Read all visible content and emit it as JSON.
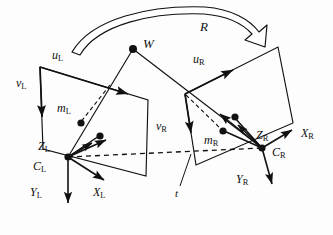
{
  "figure": {
    "background_color": "#fdfdfd",
    "stroke_color": "#111111",
    "labels": {
      "rotation": "R",
      "translation": "t",
      "world_point": "W",
      "left_image_point": "m",
      "left_image_point_sub": "L",
      "right_image_point": "m",
      "right_image_point_sub": "R",
      "left_u_axis": "u",
      "left_u_axis_sub": "L",
      "left_v_axis": "v",
      "left_v_axis_sub": "L",
      "right_u_axis": "u",
      "right_u_axis_sub": "R",
      "right_v_axis": "v",
      "right_v_axis_sub": "R",
      "left_center": "C",
      "left_center_sub": "L",
      "left_x_axis": "X",
      "left_x_axis_sub": "L",
      "left_y_axis": "Y",
      "left_y_axis_sub": "L",
      "left_z_axis": "Z",
      "left_z_axis_sub": "L",
      "right_center": "C",
      "right_center_sub": "R",
      "right_x_axis": "X",
      "right_x_axis_sub": "R",
      "right_y_axis": "Y",
      "right_y_axis_sub": "R",
      "right_z_axis": "Z",
      "right_z_axis_sub": "R"
    },
    "label_positions": {
      "rotation": {
        "x": 200,
        "y": 27,
        "size": "size-main"
      },
      "world_point": {
        "x": 143,
        "y": 44,
        "size": "size-main"
      },
      "left_u_axis": {
        "x": 52,
        "y": 56,
        "size": "size-axis"
      },
      "left_v_axis": {
        "x": 18,
        "y": 84,
        "size": "size-axis"
      },
      "left_image_point": {
        "x": 58,
        "y": 109,
        "size": "size-axis"
      },
      "right_u_axis": {
        "x": 193,
        "y": 60,
        "size": "size-axis"
      },
      "right_v_axis": {
        "x": 157,
        "y": 127,
        "size": "size-axis"
      },
      "right_image_point": {
        "x": 205,
        "y": 141,
        "size": "size-axis"
      },
      "left_z_axis": {
        "x": 40,
        "y": 147,
        "size": "size-axis"
      },
      "left_center": {
        "x": 34,
        "y": 166,
        "size": "size-axis"
      },
      "left_y_axis": {
        "x": 31,
        "y": 192,
        "size": "size-axis"
      },
      "left_x_axis": {
        "x": 94,
        "y": 192,
        "size": "size-axis"
      },
      "right_z_axis": {
        "x": 258,
        "y": 136,
        "size": "size-axis"
      },
      "right_x_axis": {
        "x": 303,
        "y": 135,
        "size": "size-axis"
      },
      "right_center": {
        "x": 274,
        "y": 152,
        "size": "size-axis"
      },
      "right_y_axis": {
        "x": 238,
        "y": 180,
        "size": "size-axis"
      },
      "translation": {
        "x": 176,
        "y": 193,
        "size": "size-small"
      }
    },
    "geometry": {
      "left_plane": "40,67 148,100 146,176 43,149",
      "right_plane": "185,94 278,47 293,123 196,165",
      "left_plane_u_edge": "40,67 148,100",
      "left_plane_v_edge": "40,67 43,149",
      "right_plane_u_edge": "185,94 278,47",
      "right_plane_v_edge": "185,94 196,165",
      "baseline_dashed": "68,157 262,148",
      "world_to_left_dashed": "133,49 82,122",
      "world_to_right_dashed": "133,49 212,128",
      "ray_left_full": "133,49 68,157",
      "ray_right_full": "133,49 262,148",
      "world_point_xy": "133,49",
      "left_center_xy": "68,157",
      "right_center_xy": "262,148",
      "left_image_dot_xy": "82,122",
      "left_second_dot_xy": "100,137",
      "right_image_dot_xy": "224,131",
      "right_second_dot_xy": "234,117",
      "left_axis_x_end": "110,181",
      "left_axis_y_end": "68,208",
      "left_axis_z_end": "106,139",
      "right_axis_x_end": "296,128",
      "right_axis_y_end": "276,188",
      "right_axis_z_end": "218,113",
      "translation_leader": "178,185 190,155",
      "rotation_arc_outer": "76,48 120,17 200,8 253,34",
      "rotation_arc_inner": "83,45 122,22 198,14 248,37"
    }
  }
}
